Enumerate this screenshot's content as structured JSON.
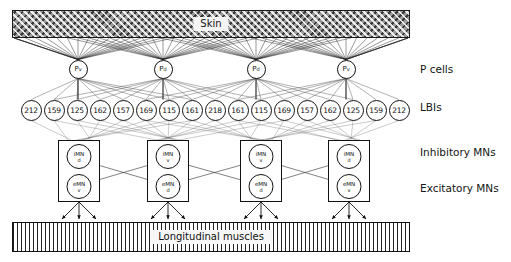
{
  "figure": {
    "skin": {
      "label": "Skin"
    },
    "muscles": {
      "label": "Longitudinal muscles"
    },
    "row_labels": [
      {
        "id": "p-cells",
        "text": "P cells"
      },
      {
        "id": "lbis",
        "text": "LBIs"
      },
      {
        "id": "inhibitory-mns",
        "text": "Inhibitory MNs"
      },
      {
        "id": "excitatory-mns",
        "text": "Excitatory MNs"
      }
    ],
    "p_cells": [
      {
        "name": "P",
        "sub": "v",
        "x": 78
      },
      {
        "name": "P",
        "sub": "d",
        "x": 163
      },
      {
        "name": "P",
        "sub": "d",
        "x": 256
      },
      {
        "name": "P",
        "sub": "v",
        "x": 346
      }
    ],
    "lbis": [
      {
        "value": "212",
        "x": 31
      },
      {
        "value": "159",
        "x": 54
      },
      {
        "value": "125",
        "x": 77
      },
      {
        "value": "162",
        "x": 100
      },
      {
        "value": "157",
        "x": 123
      },
      {
        "value": "169",
        "x": 146
      },
      {
        "value": "115",
        "x": 169
      },
      {
        "value": "161",
        "x": 192
      },
      {
        "value": "218",
        "x": 215
      },
      {
        "value": "161",
        "x": 238
      },
      {
        "value": "115",
        "x": 261
      },
      {
        "value": "169",
        "x": 284
      },
      {
        "value": "157",
        "x": 307
      },
      {
        "value": "162",
        "x": 330
      },
      {
        "value": "125",
        "x": 353
      },
      {
        "value": "159",
        "x": 376
      },
      {
        "value": "212",
        "x": 399
      }
    ],
    "mn_boxes": [
      {
        "x": 58,
        "inhibitory": {
          "name": "iMN",
          "sub": "d"
        },
        "excitatory": {
          "name": "eMN",
          "sub": "v"
        },
        "synapse_side": "right"
      },
      {
        "x": 147,
        "inhibitory": {
          "name": "iMN",
          "sub": "v"
        },
        "excitatory": {
          "name": "eMN",
          "sub": "d"
        },
        "synapse_side": "left"
      },
      {
        "x": 240,
        "inhibitory": {
          "name": "iMN",
          "sub": "v"
        },
        "excitatory": {
          "name": "eMN",
          "sub": "d"
        },
        "synapse_side": "right"
      },
      {
        "x": 328,
        "inhibitory": {
          "name": "iMN",
          "sub": "d"
        },
        "excitatory": {
          "name": "eMN",
          "sub": "v"
        },
        "synapse_side": "left"
      }
    ],
    "colors": {
      "stroke": "#111111",
      "skin_fill": "#9a9a9a",
      "background": "#ffffff"
    }
  }
}
